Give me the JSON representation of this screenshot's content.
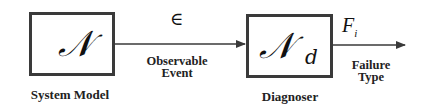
{
  "diagram": {
    "type": "block-diagram",
    "nodes": [
      {
        "id": "system-model",
        "symbol": "𝒩",
        "subscript": "",
        "label": "System Model"
      },
      {
        "id": "diagnoser",
        "symbol": "𝒩",
        "subscript": "d",
        "label": "Diagnoser"
      }
    ],
    "edges": [
      {
        "from": "system-model",
        "to": "diagnoser",
        "symbol": "∈",
        "label_line1": "Observable",
        "label_line2": "Event"
      },
      {
        "from": "diagnoser",
        "to": "output",
        "symbol": "F",
        "symbol_subscript": "i",
        "label_line1": "Failure",
        "label_line2": "Type"
      }
    ],
    "colors": {
      "stroke": "#3a3a3a",
      "text": "#222222",
      "background": "#ffffff"
    }
  }
}
